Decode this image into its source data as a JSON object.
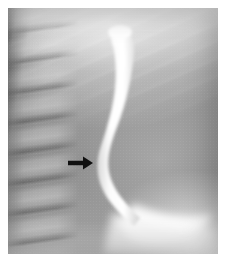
{
  "figure": {
    "modality": "radiograph",
    "study": "barium esophagram",
    "projection": "lateral",
    "background_color": "#ffffff",
    "plate": {
      "x": 8,
      "y": 8,
      "width": 210,
      "height": 246,
      "base_gray": "#8b8b8b",
      "dark_edge_color": "#141414",
      "bright_highlight_color": "#ffffff"
    }
  },
  "anatomy": {
    "spine": {
      "name": "thoracic-vertebral-bodies",
      "region": "left",
      "appearance": "stacked lighter vertebral bodies with dark intervertebral disc spaces"
    },
    "ribs": {
      "name": "rib-and-scapular-striations",
      "region": "upper",
      "appearance": "oblique bright linear streaks"
    },
    "mediastinum": {
      "name": "mediastinal-soft-tissue",
      "region": "right-central",
      "appearance": "uniform mid-gray soft tissue shadow"
    },
    "gastric_fundus": {
      "name": "gastric-fundus-barium-pool",
      "region": "inferior-right",
      "appearance": "bright white fan of contrast entering the stomach"
    }
  },
  "contrast_column": {
    "name": "barium-filled-esophagus",
    "color": "#fdfdfd",
    "description": "dilated proximal esophageal barium column tapering to a narrow distal segment",
    "dilated_segment": {
      "top_y": 22,
      "bottom_y": 130,
      "max_width_px": 26
    },
    "tapered_segment": {
      "top_y": 130,
      "bottom_y": 210,
      "min_width_px": 5
    }
  },
  "annotation": {
    "arrow": {
      "name": "pointer-arrow",
      "color": "#101010",
      "direction": "right",
      "shaft": {
        "x1": 68,
        "y1": 163,
        "x2": 85,
        "y2": 163
      },
      "tip": {
        "x": 93,
        "y": 163
      },
      "points_to": "distal esophageal narrowing"
    }
  }
}
